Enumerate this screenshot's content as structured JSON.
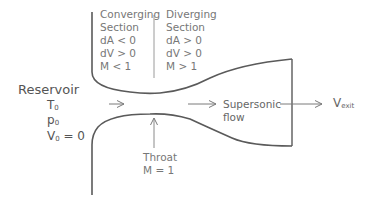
{
  "diagram": {
    "converging": {
      "lines": [
        "Converging",
        "Section",
        "dA < 0",
        "dV > 0",
        "M < 1"
      ]
    },
    "diverging": {
      "lines": [
        "Diverging",
        "Section",
        "dA > 0",
        "dV > 0",
        "M > 1"
      ]
    },
    "reservoir": {
      "label": "Reservoir",
      "T": "T",
      "T_sub": "0",
      "p": "p",
      "p_sub": "0",
      "V": "V",
      "V_sub": "0",
      "V_eq": " = 0"
    },
    "throat": {
      "lines": [
        "Throat",
        "M = 1"
      ]
    },
    "flow": {
      "lines": [
        "Supersonic",
        "flow"
      ]
    },
    "exit": {
      "V": "V",
      "V_sub": "exit"
    },
    "colors": {
      "wall": "#5a5a5a",
      "arrow": "#7a7a7a",
      "text": "#6b6b6b"
    }
  }
}
